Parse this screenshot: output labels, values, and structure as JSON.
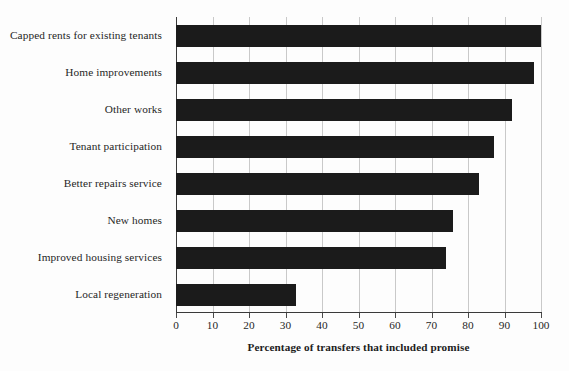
{
  "chart_data": {
    "type": "bar",
    "orientation": "horizontal",
    "title": "",
    "xlabel": "Percentage of transfers that included promise",
    "ylabel": "",
    "xlim": [
      0,
      100
    ],
    "xticks": [
      0,
      10,
      20,
      30,
      40,
      50,
      60,
      70,
      80,
      90,
      100
    ],
    "xtick_labels": [
      "0",
      "10",
      "20",
      "30",
      "40",
      "50",
      "60",
      "70",
      "80",
      "90",
      "100"
    ],
    "grid": true,
    "legend": false,
    "bar_color": "#1b1b1b",
    "categories": [
      "Capped rents for existing tenants",
      "Home improvements",
      "Other works",
      "Tenant participation",
      "Better repairs service",
      "New homes",
      "Improved housing services",
      "Local regeneration"
    ],
    "values": [
      100,
      98,
      92,
      87,
      83,
      76,
      74,
      33
    ]
  }
}
